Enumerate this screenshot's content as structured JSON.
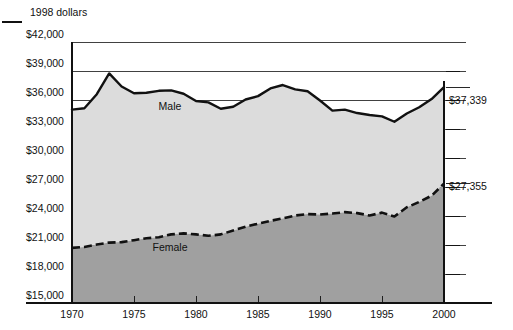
{
  "chart_data": {
    "type": "area",
    "title": "",
    "subtitle": "",
    "unit_note": "1998 dollars",
    "xlabel": "",
    "ylabel": "",
    "xlim": [
      1970,
      2000
    ],
    "ylim": [
      15000,
      42000
    ],
    "grid": true,
    "legend_position": "inline-annotation",
    "y_ticks": [
      15000,
      18000,
      21000,
      24000,
      27000,
      30000,
      33000,
      36000,
      39000,
      42000
    ],
    "y_tick_labels": [
      "$15,000",
      "$18,000",
      "$21,000",
      "$24,000",
      "$27,000",
      "$30,000",
      "$33,000",
      "$36,000",
      "$39,000",
      "$42,000"
    ],
    "x_ticks": [
      1970,
      1975,
      1980,
      1985,
      1990,
      1995,
      2000
    ],
    "x_tick_labels": [
      "1970",
      "1975",
      "1980",
      "1985",
      "1990",
      "1995",
      "2000"
    ],
    "x": [
      1970,
      1971,
      1972,
      1973,
      1974,
      1975,
      1976,
      1977,
      1978,
      1979,
      1980,
      1981,
      1982,
      1983,
      1984,
      1985,
      1986,
      1987,
      1988,
      1989,
      1990,
      1991,
      1992,
      1993,
      1994,
      1995,
      1996,
      1997,
      1998,
      1999,
      2000
    ],
    "series": [
      {
        "name": "Male",
        "label": "Male",
        "line_style": "solid",
        "fill_color": "#dcdcdc",
        "line_color": "#111111",
        "endpoint_label": "$37,339",
        "endpoint_value": 37339,
        "values": [
          35000,
          35150,
          36600,
          38750,
          37400,
          36700,
          36750,
          36950,
          37000,
          36650,
          35900,
          35750,
          35100,
          35300,
          36050,
          36400,
          37200,
          37550,
          37100,
          36900,
          35950,
          34900,
          35000,
          34650,
          34450,
          34300,
          33750,
          34600,
          35250,
          36100,
          37339
        ]
      },
      {
        "name": "Female",
        "label": "Female",
        "line_style": "dashed",
        "fill_color": "#a0a0a0",
        "line_color": "#111111",
        "endpoint_label": "$27,355",
        "endpoint_value": 27355,
        "values": [
          20700,
          20800,
          21050,
          21250,
          21300,
          21500,
          21700,
          21800,
          22100,
          22200,
          22100,
          21950,
          22100,
          22500,
          22900,
          23200,
          23500,
          23750,
          24050,
          24200,
          24150,
          24250,
          24400,
          24300,
          24050,
          24350,
          23950,
          24900,
          25450,
          26100,
          27355
        ]
      }
    ]
  },
  "annotations": {
    "male_label": "Male",
    "female_label": "Female",
    "unit_note": "1998 dollars"
  },
  "colors": {
    "male_band": "#dcdcdc",
    "female_band": "#a0a0a0",
    "line": "#111111",
    "background": "#ffffff"
  }
}
